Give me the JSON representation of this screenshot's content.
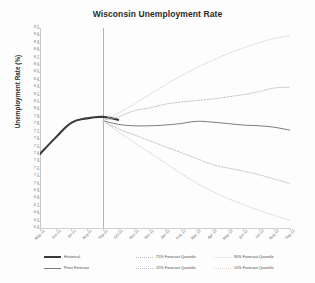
{
  "chart_data": {
    "type": "line",
    "title": "Wisconsin Unemployment Rate",
    "xlabel": "",
    "ylabel": "Unemployment Rate (%)",
    "ylim": [
      6.4,
      9.1
    ],
    "ytick_step": 0.1,
    "grid": false,
    "legend_position": "bottom",
    "forecast_origin": "Sep-11",
    "categories": [
      "May-11",
      "Jun-11",
      "Jul-11",
      "Aug-11",
      "Sep-11",
      "Oct-11",
      "Nov-11",
      "Dec-11",
      "Jan-12",
      "Feb-12",
      "Mar-12",
      "Apr-12",
      "May-12",
      "Jun-12",
      "Jul-12",
      "Aug-12",
      "Sep-12"
    ],
    "yticks": [
      "9.1",
      "9.0",
      "8.9",
      "8.8",
      "8.7",
      "8.6",
      "8.5",
      "8.4",
      "8.3",
      "8.2",
      "8.1",
      "8.0",
      "7.9",
      "7.8",
      "7.7",
      "7.6",
      "7.5",
      "7.4",
      "7.3",
      "7.2",
      "7.1",
      "7.0",
      "6.9",
      "6.8",
      "6.7",
      "6.6",
      "6.5",
      "6.4"
    ],
    "series": [
      {
        "name": "Historical",
        "color": "#3a3a3a",
        "style": "solid",
        "width": 2.1,
        "values": [
          7.4,
          7.62,
          7.82,
          7.88,
          7.9,
          7.86,
          null,
          null,
          null,
          null,
          null,
          null,
          null,
          null,
          null,
          null,
          null
        ]
      },
      {
        "name": "Point Forecast",
        "color": "#7b7b7b",
        "style": "solid",
        "width": 1.0,
        "values": [
          null,
          null,
          null,
          null,
          7.85,
          7.8,
          7.78,
          7.78,
          7.79,
          7.81,
          7.84,
          7.83,
          7.81,
          7.79,
          7.78,
          7.76,
          7.72
        ]
      },
      {
        "name": "75% Forecast Quantile",
        "color": "#bdbdbd",
        "style": "dotted",
        "width": 1.0,
        "values": [
          null,
          null,
          null,
          null,
          7.85,
          7.9,
          7.98,
          8.02,
          8.07,
          8.1,
          8.12,
          8.14,
          8.17,
          8.2,
          8.24,
          8.29,
          8.3
        ]
      },
      {
        "name": "25% Forecast Quantile",
        "color": "#bdbdbd",
        "style": "dotted",
        "width": 1.0,
        "values": [
          null,
          null,
          null,
          null,
          7.85,
          7.74,
          7.66,
          7.58,
          7.5,
          7.42,
          7.34,
          7.26,
          7.21,
          7.17,
          7.12,
          7.06,
          7.0
        ]
      },
      {
        "name": "90% Forecast Quantile",
        "color": "#d6d6d6",
        "style": "dotted",
        "width": 1.0,
        "values": [
          null,
          null,
          null,
          null,
          7.85,
          7.95,
          8.07,
          8.2,
          8.33,
          8.45,
          8.56,
          8.66,
          8.75,
          8.83,
          8.9,
          8.96,
          9.0
        ]
      },
      {
        "name": "10% Forecast Quantile",
        "color": "#d6d6d6",
        "style": "dotted",
        "width": 1.0,
        "values": [
          null,
          null,
          null,
          null,
          7.85,
          7.7,
          7.56,
          7.42,
          7.28,
          7.14,
          7.01,
          6.9,
          6.8,
          6.72,
          6.64,
          6.57,
          6.5
        ]
      }
    ]
  },
  "legend": {
    "items": [
      {
        "label": "Historical",
        "color": "#3a3a3a",
        "style": "solid",
        "width": 2.1,
        "col": 0,
        "row": 0
      },
      {
        "label": "Point Forecast",
        "color": "#7b7b7b",
        "style": "solid",
        "width": 1.0,
        "col": 0,
        "row": 1
      },
      {
        "label": "75% Forecast Quantile",
        "color": "#bdbdbd",
        "style": "dotted",
        "width": 1.0,
        "col": 1,
        "row": 0
      },
      {
        "label": "25% Forecast Quantile",
        "color": "#bdbdbd",
        "style": "dotted",
        "width": 1.0,
        "col": 1,
        "row": 1
      },
      {
        "label": "90% Forecast Quantile",
        "color": "#d6d6d6",
        "style": "dotted",
        "width": 1.0,
        "col": 2,
        "row": 0
      },
      {
        "label": "10% Forecast Quantile",
        "color": "#d6d6d6",
        "style": "dotted",
        "width": 1.0,
        "col": 2,
        "row": 1
      }
    ]
  }
}
